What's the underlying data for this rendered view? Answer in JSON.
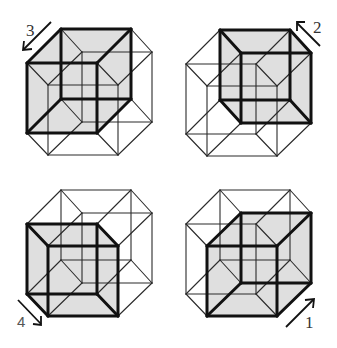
{
  "diagram": {
    "colors": {
      "highlight_fill": "#c9c9c9",
      "bold_edge": "#111111",
      "thin_edge": "#2a2a2a",
      "background": "#ffffff"
    },
    "square_size": 70,
    "squares_base": {
      "A": [
        61,
        29
      ],
      "B": [
        27,
        63
      ],
      "C": [
        48,
        85
      ],
      "D": [
        82,
        52
      ]
    },
    "panels": [
      {
        "id": "top-left",
        "offset": [
          0,
          0
        ],
        "highlighted_cell": [
          "A",
          "B"
        ],
        "step_label": "3",
        "arrow_direction": "down-left"
      },
      {
        "id": "top-right",
        "offset": [
          159,
          1
        ],
        "highlighted_cell": [
          "A",
          "D"
        ],
        "step_label": "2",
        "arrow_direction": "up-left"
      },
      {
        "id": "bottom-left",
        "offset": [
          0,
          161
        ],
        "highlighted_cell": [
          "B",
          "C"
        ],
        "step_label": "4",
        "arrow_direction": "down-right"
      },
      {
        "id": "bottom-right",
        "offset": [
          159,
          161
        ],
        "highlighted_cell": [
          "C",
          "D"
        ],
        "step_label": "1",
        "arrow_direction": "up-right"
      }
    ],
    "labels": {
      "step1": "1",
      "step2": "2",
      "step3": "3",
      "step4": "4"
    }
  }
}
